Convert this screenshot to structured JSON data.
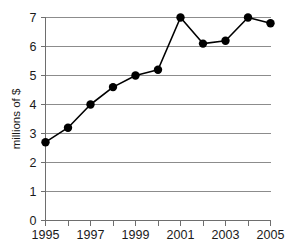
{
  "chart_data": {
    "type": "line",
    "title": "",
    "subtitle": "",
    "xlabel": "",
    "ylabel": "millions of $",
    "x": [
      1995,
      1996,
      1997,
      1998,
      1999,
      2000,
      2001,
      2002,
      2003,
      2004,
      2005
    ],
    "values": [
      2.7,
      3.2,
      4.0,
      4.6,
      5.0,
      5.2,
      7.0,
      6.1,
      6.2,
      7.0,
      6.8
    ],
    "series": [
      {
        "name": "",
        "values": [
          2.7,
          3.2,
          4.0,
          4.6,
          5.0,
          5.2,
          7.0,
          6.1,
          6.2,
          7.0,
          6.8
        ]
      }
    ],
    "xlim": [
      1995,
      2005
    ],
    "ylim": [
      0,
      7
    ],
    "x_tick_values": [
      1995,
      1996,
      1997,
      1998,
      1999,
      2000,
      2001,
      2002,
      2003,
      2004,
      2005
    ],
    "x_tick_labels": [
      "1995",
      "",
      "1997",
      "",
      "1999",
      "",
      "2001",
      "",
      "2003",
      "",
      "2005"
    ],
    "y_tick_values": [
      0,
      1,
      2,
      3,
      4,
      5,
      6,
      7
    ],
    "y_tick_labels": [
      "0",
      "1",
      "2",
      "3",
      "4",
      "5",
      "6",
      "7"
    ],
    "grid": true,
    "grid_axis": "y",
    "legend": false,
    "legend_position": "none",
    "annotations": [],
    "colors": {
      "line": "#000000",
      "marker": "#000000",
      "grid": "#8c8c8c",
      "axis": "#6e6e6e",
      "text": "#1a1a1a",
      "background": "#ffffff"
    },
    "marker": "circle",
    "marker_size": 4.2,
    "line_width": 1.6
  }
}
